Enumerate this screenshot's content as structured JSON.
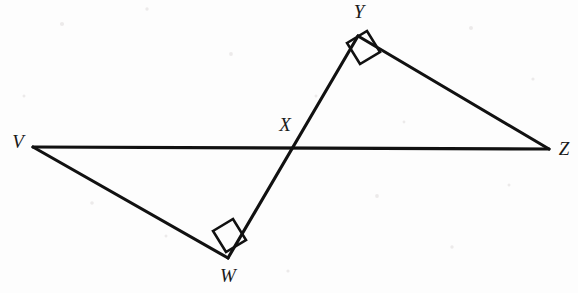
{
  "figure": {
    "kind": "geometry-diagram",
    "background_color": "#fdfdfd",
    "stroke_color": "#111111",
    "label_color": "#1a1a1a",
    "points": [
      {
        "id": "V",
        "label": "V",
        "x": 33,
        "y": 147,
        "label_x": 18,
        "label_y": 144
      },
      {
        "id": "W",
        "label": "W",
        "x": 228,
        "y": 258,
        "label_x": 228,
        "label_y": 278
      },
      {
        "id": "X",
        "label": "X",
        "x": 292,
        "y": 148,
        "label_x": 285,
        "label_y": 127
      },
      {
        "id": "Y",
        "label": "Y",
        "x": 358,
        "y": 36,
        "label_x": 359,
        "label_y": 14
      },
      {
        "id": "Z",
        "label": "Z",
        "x": 549,
        "y": 149,
        "label_x": 564,
        "label_y": 151
      }
    ],
    "segments": [
      {
        "id": "VZ",
        "from": "V",
        "to": "Z",
        "path": "M33,147 L549,149"
      },
      {
        "id": "WY",
        "from": "W",
        "to": "Y",
        "path": "M228,258 L358,36"
      },
      {
        "id": "VW",
        "from": "V",
        "to": "W",
        "path": "M33,147 L228,258"
      },
      {
        "id": "YZ",
        "from": "Y",
        "to": "Z",
        "path": "M358,36 L549,149"
      }
    ],
    "right_angles": [
      {
        "id": "angle-W",
        "at": "W",
        "path": "M213,231 L233,219 L246,240 L226,252 Z"
      },
      {
        "id": "angle-Y",
        "at": "Y",
        "path": "M347,43 L367,31 L380,52 L360,64 Z"
      }
    ]
  }
}
